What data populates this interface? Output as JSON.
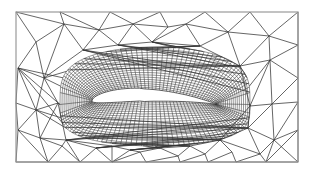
{
  "figure": {
    "type": "mesh",
    "frame": {
      "x": 16,
      "y": 12,
      "w": 282,
      "h": 150,
      "stroke": "#9a9a9a"
    },
    "colors": {
      "line": "#333333",
      "background": "#ffffff",
      "airfoil_fill": "#ffffff"
    },
    "airfoil": {
      "leading_edge": [
        92,
        101
      ],
      "trailing_edge": [
        216,
        104
      ],
      "thickness": 17,
      "camber": 6
    },
    "ogrid": {
      "outer_left": [
        60,
        103
      ],
      "outer_right": [
        250,
        106
      ],
      "outer_top": 47,
      "outer_bottom": 146,
      "radial_layers": 18,
      "circumferential_lines": 110
    },
    "far_field_nodes": [
      [
        16,
        12
      ],
      [
        60,
        12
      ],
      [
        110,
        12
      ],
      [
        160,
        12
      ],
      [
        205,
        12
      ],
      [
        250,
        12
      ],
      [
        298,
        12
      ],
      [
        36,
        42
      ],
      [
        64,
        24
      ],
      [
        99,
        30
      ],
      [
        133,
        24
      ],
      [
        168,
        27
      ],
      [
        186,
        24
      ],
      [
        228,
        32
      ],
      [
        269,
        36
      ],
      [
        298,
        45
      ],
      [
        18,
        68
      ],
      [
        44,
        78
      ],
      [
        83,
        50
      ],
      [
        118,
        45
      ],
      [
        152,
        42
      ],
      [
        200,
        46
      ],
      [
        240,
        66
      ],
      [
        270,
        60
      ],
      [
        298,
        78
      ],
      [
        16,
        103
      ],
      [
        36,
        110
      ],
      [
        58,
        103
      ],
      [
        250,
        106
      ],
      [
        272,
        104
      ],
      [
        298,
        102
      ],
      [
        18,
        130
      ],
      [
        40,
        138
      ],
      [
        66,
        140
      ],
      [
        96,
        148
      ],
      [
        130,
        150
      ],
      [
        160,
        148
      ],
      [
        190,
        146
      ],
      [
        220,
        140
      ],
      [
        248,
        128
      ],
      [
        274,
        140
      ],
      [
        298,
        130
      ],
      [
        16,
        162
      ],
      [
        48,
        162
      ],
      [
        80,
        162
      ],
      [
        112,
        162
      ],
      [
        146,
        162
      ],
      [
        180,
        162
      ],
      [
        208,
        162
      ],
      [
        236,
        162
      ],
      [
        266,
        162
      ],
      [
        298,
        162
      ],
      [
        62,
        146
      ],
      [
        112,
        146
      ],
      [
        140,
        152
      ],
      [
        178,
        156
      ],
      [
        205,
        154
      ],
      [
        232,
        152
      ],
      [
        260,
        154
      ]
    ],
    "far_field_edges": [
      [
        0,
        8
      ],
      [
        8,
        1
      ],
      [
        1,
        9
      ],
      [
        9,
        2
      ],
      [
        2,
        10
      ],
      [
        10,
        3
      ],
      [
        3,
        11
      ],
      [
        11,
        12
      ],
      [
        12,
        4
      ],
      [
        4,
        13
      ],
      [
        13,
        5
      ],
      [
        5,
        14
      ],
      [
        14,
        6
      ],
      [
        0,
        7
      ],
      [
        7,
        8
      ],
      [
        8,
        9
      ],
      [
        9,
        10
      ],
      [
        10,
        11
      ],
      [
        12,
        13
      ],
      [
        13,
        14
      ],
      [
        14,
        15
      ],
      [
        6,
        15
      ],
      [
        7,
        16
      ],
      [
        7,
        17
      ],
      [
        8,
        17
      ],
      [
        8,
        18
      ],
      [
        9,
        18
      ],
      [
        9,
        19
      ],
      [
        10,
        19
      ],
      [
        10,
        20
      ],
      [
        11,
        20
      ],
      [
        12,
        20
      ],
      [
        12,
        21
      ],
      [
        13,
        21
      ],
      [
        13,
        22
      ],
      [
        14,
        22
      ],
      [
        14,
        23
      ],
      [
        15,
        23
      ],
      [
        15,
        24
      ],
      [
        16,
        17
      ],
      [
        17,
        18
      ],
      [
        18,
        19
      ],
      [
        19,
        20
      ],
      [
        20,
        21
      ],
      [
        21,
        22
      ],
      [
        22,
        23
      ],
      [
        23,
        24
      ],
      [
        16,
        25
      ],
      [
        16,
        26
      ],
      [
        17,
        26
      ],
      [
        17,
        27
      ],
      [
        25,
        26
      ],
      [
        26,
        27
      ],
      [
        22,
        28
      ],
      [
        23,
        28
      ],
      [
        23,
        29
      ],
      [
        24,
        29
      ],
      [
        24,
        30
      ],
      [
        28,
        29
      ],
      [
        29,
        30
      ],
      [
        25,
        31
      ],
      [
        26,
        31
      ],
      [
        26,
        32
      ],
      [
        27,
        32
      ],
      [
        27,
        33
      ],
      [
        31,
        32
      ],
      [
        32,
        33
      ],
      [
        28,
        39
      ],
      [
        29,
        39
      ],
      [
        29,
        40
      ],
      [
        30,
        40
      ],
      [
        30,
        41
      ],
      [
        39,
        40
      ],
      [
        40,
        41
      ],
      [
        28,
        38
      ],
      [
        38,
        39
      ],
      [
        31,
        42
      ],
      [
        31,
        43
      ],
      [
        32,
        43
      ],
      [
        32,
        52
      ],
      [
        33,
        52
      ],
      [
        33,
        44
      ],
      [
        52,
        44
      ],
      [
        52,
        43
      ],
      [
        33,
        34
      ],
      [
        34,
        44
      ],
      [
        34,
        53
      ],
      [
        34,
        45
      ],
      [
        53,
        45
      ],
      [
        53,
        35
      ],
      [
        35,
        54
      ],
      [
        54,
        46
      ],
      [
        35,
        45
      ],
      [
        54,
        45
      ],
      [
        35,
        36
      ],
      [
        36,
        54
      ],
      [
        36,
        55
      ],
      [
        55,
        46
      ],
      [
        55,
        47
      ],
      [
        36,
        37
      ],
      [
        37,
        55
      ],
      [
        37,
        56
      ],
      [
        56,
        47
      ],
      [
        56,
        48
      ],
      [
        37,
        38
      ],
      [
        38,
        56
      ],
      [
        38,
        57
      ],
      [
        57,
        48
      ],
      [
        57,
        49
      ],
      [
        38,
        58
      ],
      [
        39,
        58
      ],
      [
        58,
        49
      ],
      [
        58,
        50
      ],
      [
        40,
        58
      ],
      [
        40,
        50
      ],
      [
        41,
        50
      ],
      [
        41,
        51
      ],
      [
        40,
        51
      ],
      [
        42,
        43
      ],
      [
        43,
        44
      ],
      [
        44,
        45
      ],
      [
        45,
        46
      ],
      [
        46,
        47
      ],
      [
        47,
        48
      ],
      [
        48,
        49
      ],
      [
        49,
        50
      ],
      [
        50,
        51
      ],
      [
        33,
        53
      ],
      [
        66,
        140
      ]
    ],
    "ogrid_anchor_edges_top": [
      [
        18,
        0.05
      ],
      [
        19,
        0.2
      ],
      [
        20,
        0.38
      ],
      [
        21,
        0.62
      ],
      [
        22,
        0.82
      ]
    ],
    "ogrid_anchor_edges_bottom": [
      [
        33,
        0.08
      ],
      [
        34,
        0.2
      ],
      [
        35,
        0.35
      ],
      [
        36,
        0.5
      ],
      [
        37,
        0.65
      ],
      [
        38,
        0.8
      ],
      [
        39,
        0.93
      ]
    ]
  }
}
